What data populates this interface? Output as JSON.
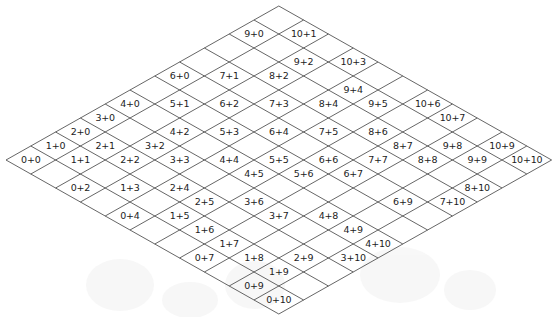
{
  "figure": {
    "kind": "addition-rhombus-lattice",
    "title": "",
    "size": 11,
    "geometry": {
      "left_vertex_x": 6,
      "left_vertex_y": 160,
      "top_vertex_x": 279,
      "top_vertex_y": 5,
      "right_vertex_x": 551,
      "right_vertex_y": 160,
      "bottom_vertex_x": 279,
      "bottom_vertex_y": 313,
      "cell_half_width": 24.8,
      "cell_half_height": 14.0,
      "line_color": "#4a4a4a",
      "text_color": "#1c1c1c",
      "background_color": "#ffffff",
      "watermark_color": "#f2f2f2"
    },
    "plus_sign": "+",
    "labels": [
      {
        "i": 0,
        "j": 0,
        "text": "0+0"
      },
      {
        "i": 1,
        "j": 0,
        "text": "1+0"
      },
      {
        "i": 1,
        "j": 1,
        "text": "1+1"
      },
      {
        "i": 0,
        "j": 2,
        "text": "0+2"
      },
      {
        "i": 2,
        "j": 0,
        "text": "2+0"
      },
      {
        "i": 2,
        "j": 1,
        "text": "2+1"
      },
      {
        "i": 2,
        "j": 2,
        "text": "2+2"
      },
      {
        "i": 1,
        "j": 3,
        "text": "1+3"
      },
      {
        "i": 0,
        "j": 4,
        "text": "0+4"
      },
      {
        "i": 3,
        "j": 0,
        "text": "3+0"
      },
      {
        "i": 3,
        "j": 2,
        "text": "3+2"
      },
      {
        "i": 3,
        "j": 3,
        "text": "3+3"
      },
      {
        "i": 2,
        "j": 4,
        "text": "2+4"
      },
      {
        "i": 1,
        "j": 5,
        "text": "1+5"
      },
      {
        "i": 1,
        "j": 6,
        "text": "1+6"
      },
      {
        "i": 4,
        "j": 0,
        "text": "4+0"
      },
      {
        "i": 4,
        "j": 2,
        "text": "4+2"
      },
      {
        "i": 4,
        "j": 4,
        "text": "4+4"
      },
      {
        "i": 4,
        "j": 5,
        "text": "4+5"
      },
      {
        "i": 2,
        "j": 5,
        "text": "2+5"
      },
      {
        "i": 5,
        "j": 1,
        "text": "5+1"
      },
      {
        "i": 5,
        "j": 3,
        "text": "5+3"
      },
      {
        "i": 5,
        "j": 5,
        "text": "5+5"
      },
      {
        "i": 5,
        "j": 6,
        "text": "5+6"
      },
      {
        "i": 3,
        "j": 6,
        "text": "3+6"
      },
      {
        "i": 3,
        "j": 7,
        "text": "3+7"
      },
      {
        "i": 6,
        "j": 0,
        "text": "6+0"
      },
      {
        "i": 6,
        "j": 2,
        "text": "6+2"
      },
      {
        "i": 6,
        "j": 4,
        "text": "6+4"
      },
      {
        "i": 6,
        "j": 6,
        "text": "6+6"
      },
      {
        "i": 6,
        "j": 7,
        "text": "6+7"
      },
      {
        "i": 6,
        "j": 9,
        "text": "6+9"
      },
      {
        "i": 7,
        "j": 1,
        "text": "7+1"
      },
      {
        "i": 7,
        "j": 3,
        "text": "7+3"
      },
      {
        "i": 7,
        "j": 5,
        "text": "7+5"
      },
      {
        "i": 7,
        "j": 7,
        "text": "7+7"
      },
      {
        "i": 7,
        "j": 10,
        "text": "7+10"
      },
      {
        "i": 8,
        "j": 2,
        "text": "8+2"
      },
      {
        "i": 8,
        "j": 4,
        "text": "8+4"
      },
      {
        "i": 8,
        "j": 6,
        "text": "8+6"
      },
      {
        "i": 8,
        "j": 7,
        "text": "8+7"
      },
      {
        "i": 8,
        "j": 8,
        "text": "8+8"
      },
      {
        "i": 8,
        "j": 10,
        "text": "8+10"
      },
      {
        "i": 9,
        "j": 0,
        "text": "9+0"
      },
      {
        "i": 9,
        "j": 2,
        "text": "9+2"
      },
      {
        "i": 9,
        "j": 4,
        "text": "9+4"
      },
      {
        "i": 9,
        "j": 5,
        "text": "9+5"
      },
      {
        "i": 9,
        "j": 8,
        "text": "9+8"
      },
      {
        "i": 9,
        "j": 9,
        "text": "9+9"
      },
      {
        "i": 10,
        "j": 1,
        "text": "10+1"
      },
      {
        "i": 10,
        "j": 3,
        "text": "10+3"
      },
      {
        "i": 10,
        "j": 6,
        "text": "10+6"
      },
      {
        "i": 10,
        "j": 7,
        "text": "10+7"
      },
      {
        "i": 10,
        "j": 9,
        "text": "10+9"
      },
      {
        "i": 10,
        "j": 10,
        "text": "10+10"
      },
      {
        "i": 4,
        "j": 8,
        "text": "4+8"
      },
      {
        "i": 4,
        "j": 9,
        "text": "4+9"
      },
      {
        "i": 4,
        "j": 10,
        "text": "4+10"
      },
      {
        "i": 3,
        "j": 10,
        "text": "3+10"
      },
      {
        "i": 2,
        "j": 9,
        "text": "2+9"
      },
      {
        "i": 1,
        "j": 7,
        "text": "1+7"
      },
      {
        "i": 1,
        "j": 8,
        "text": "1+8"
      },
      {
        "i": 1,
        "j": 9,
        "text": "1+9"
      },
      {
        "i": 0,
        "j": 7,
        "text": "0+7"
      },
      {
        "i": 0,
        "j": 9,
        "text": "0+9"
      },
      {
        "i": 0,
        "j": 10,
        "text": "0+10"
      }
    ]
  }
}
